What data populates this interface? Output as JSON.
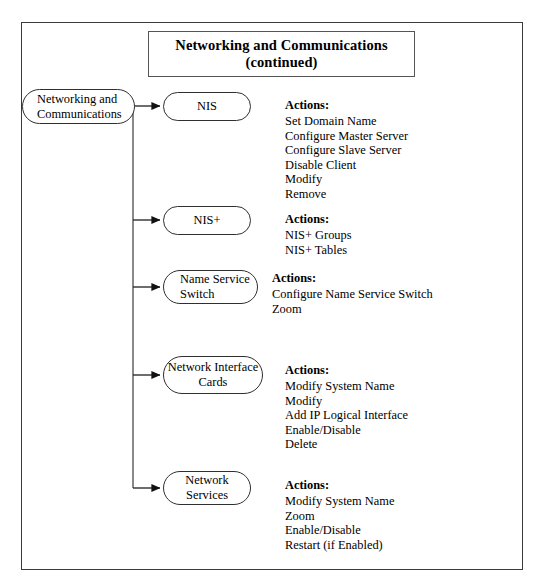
{
  "title": {
    "line1": "Networking and Communications",
    "line2": "(continued)"
  },
  "root_node": {
    "label": "Networking and\nCommunications"
  },
  "branches": [
    {
      "node_label": "NIS",
      "node_align": "center",
      "actions_title": "Actions:",
      "actions": [
        "Set Domain Name",
        "Configure Master Server",
        "Configure Slave Server",
        "Disable Client",
        "Modify",
        "Remove"
      ]
    },
    {
      "node_label": "NIS+",
      "node_align": "center",
      "actions_title": "Actions:",
      "actions": [
        "NIS+ Groups",
        "NIS+ Tables"
      ]
    },
    {
      "node_label": "Name Service\nSwitch",
      "node_align": "left",
      "actions_title": "Actions:",
      "actions": [
        "Configure Name Service Switch",
        "Zoom"
      ]
    },
    {
      "node_label": "Network Interface\nCards",
      "node_align": "center",
      "actions_title": "Actions:",
      "actions": [
        "Modify System Name",
        "Modify",
        "Add IP Logical Interface",
        "Enable/Disable",
        "Delete"
      ]
    },
    {
      "node_label": "Network\nServices",
      "node_align": "center",
      "actions_title": "Actions:",
      "actions": [
        "Modify System Name",
        "Zoom",
        "Enable/Disable",
        "Restart (if Enabled)"
      ]
    }
  ],
  "colors": {
    "line": "#2f2f2f",
    "frame": "#3a3a3a",
    "background": "#ffffff",
    "text": "#000000"
  }
}
